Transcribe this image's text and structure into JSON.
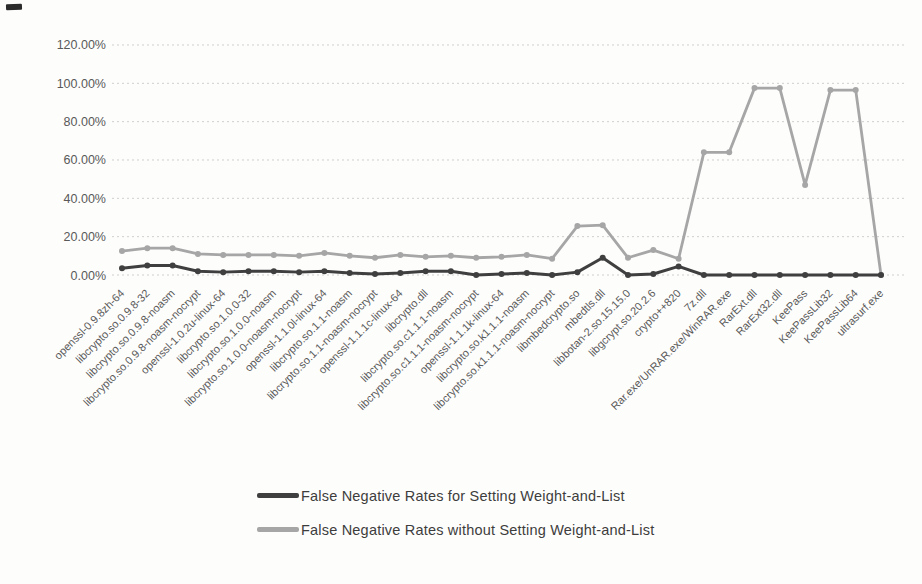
{
  "chart_data": {
    "type": "line",
    "title": "",
    "xlabel": "",
    "ylabel": "",
    "ylim": [
      0,
      120
    ],
    "yticks": [
      "120.00%",
      "100.00%",
      "80.00%",
      "60.00%",
      "40.00%",
      "20.00%",
      "0.00%"
    ],
    "grid": "horizontal-dashed",
    "legend_position": "bottom-center",
    "colors": {
      "gridline": "#cfcfcf",
      "axis_text": "#595959",
      "background": "#fdfdfc"
    },
    "categories": [
      "openssl-0.9.8zh-64",
      "libcrypto.so.0.9.8-32",
      "libcrypto.so.0.9.8-noasm",
      "libcrypto.so.0.9.8-noasm-nocrypt",
      "openssl-1.0.2u-linux-64",
      "libcrypto.so.1.0.0-32",
      "libcrypto.so.1.0.0-noasm",
      "libcrypto.so.1.0.0-noasm-nocrypt",
      "openssl-1.1.0l-linux-64",
      "libcrypto.so.1.1-noasm",
      "libcrypto.so.1.1-noasm-nocrypt",
      "openssl-1.1.1c-linux-64",
      "libcrypto.dll",
      "libcrypto.so.c1.1.1-noasm",
      "libcrypto.so.c1.1.1-noasm-nocrypt",
      "openssl-1.1.1k-linux-64",
      "libcrypto.so.k1.1.1-noasm",
      "libcrypto.so.k1.1.1-noasm-nocrypt",
      "libmbedcrypto.so",
      "mbedtls.dll",
      "libbotan-2.so.15.15.0",
      "libgcrypt.so.20.2.6",
      "crypto++820",
      "7z.dll",
      "Rar.exe/UnRAR.exe/WinRAR.exe",
      "RarExt.dll",
      "RarExt32.dll",
      "KeePass",
      "KeePassLib32",
      "KeePassLib64",
      "ultrasurf.exe"
    ],
    "series": [
      {
        "name": "False Negative Rates for Setting Weight-and-List",
        "color": "#3f3f3f",
        "values": [
          3.5,
          5,
          5,
          2,
          1.5,
          2,
          2,
          1.5,
          2,
          1,
          0.5,
          1,
          2,
          2,
          0,
          0.5,
          1,
          0,
          1.5,
          9,
          0,
          0.5,
          4.5,
          0,
          0,
          0,
          0,
          0,
          0,
          0,
          0
        ]
      },
      {
        "name": "False Negative Rates without Setting Weight-and-List",
        "color": "#a6a6a6",
        "values": [
          12.5,
          14,
          14,
          11,
          10.5,
          10.5,
          10.5,
          10,
          11.5,
          10,
          9,
          10.5,
          9.5,
          10,
          9,
          9.5,
          10.5,
          8.5,
          25.5,
          26,
          9,
          13,
          8.5,
          64,
          64,
          97.5,
          97.5,
          47,
          96.5,
          96.5,
          0
        ]
      }
    ]
  }
}
